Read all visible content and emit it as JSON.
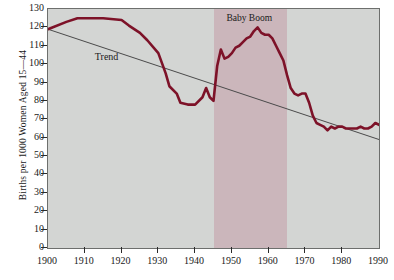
{
  "chart_data": {
    "type": "line",
    "title": "",
    "xlabel": "",
    "ylabel": "Births per 1000 Women Aged 15—44",
    "xlim": [
      1900,
      1990
    ],
    "ylim": [
      0,
      130
    ],
    "xticks": [
      1900,
      1910,
      1920,
      1930,
      1940,
      1950,
      1960,
      1970,
      1980,
      1990
    ],
    "yticks": [
      0,
      10,
      20,
      30,
      40,
      50,
      60,
      70,
      80,
      90,
      100,
      110,
      120,
      130
    ],
    "grid": false,
    "legend": "none",
    "plot_background": "#d3d5d3",
    "series": [
      {
        "name": "Birth rate",
        "color": "#7d1228",
        "x": [
          1900,
          1905,
          1908,
          1910,
          1915,
          1920,
          1922,
          1925,
          1927,
          1930,
          1932,
          1933,
          1935,
          1936,
          1938,
          1940,
          1942,
          1943,
          1944,
          1945,
          1946,
          1947,
          1948,
          1949,
          1950,
          1951,
          1952,
          1953,
          1954,
          1955,
          1956,
          1957,
          1958,
          1959,
          1960,
          1961,
          1962,
          1963,
          1964,
          1965,
          1966,
          1967,
          1968,
          1969,
          1970,
          1971,
          1972,
          1973,
          1974,
          1975,
          1976,
          1977,
          1978,
          1979,
          1980,
          1981,
          1982,
          1983,
          1984,
          1985,
          1986,
          1987,
          1988,
          1989,
          1990
        ],
        "y": [
          119,
          123,
          125,
          125,
          125,
          124,
          121,
          117,
          113,
          106,
          95,
          88,
          84,
          79,
          78,
          78,
          82,
          87,
          82,
          80,
          99,
          108,
          103,
          104,
          106,
          109,
          110,
          112,
          114,
          115,
          118,
          120,
          117,
          116,
          116,
          114,
          110,
          106,
          102,
          94,
          87,
          84,
          83,
          84,
          84,
          79,
          72,
          68,
          67,
          66,
          64,
          66,
          65,
          66,
          66,
          65,
          65,
          65,
          65,
          66,
          65,
          65,
          66,
          68,
          67
        ]
      }
    ],
    "trend_line": {
      "name": "Trend",
      "label": "Trend",
      "color": "#4a4a4a",
      "x": [
        1900,
        1990
      ],
      "y": [
        119,
        59
      ]
    },
    "shaded_region": {
      "label": "Baby Boom",
      "x_start": 1945,
      "x_end": 1965,
      "color": "#cbb6bb"
    }
  }
}
